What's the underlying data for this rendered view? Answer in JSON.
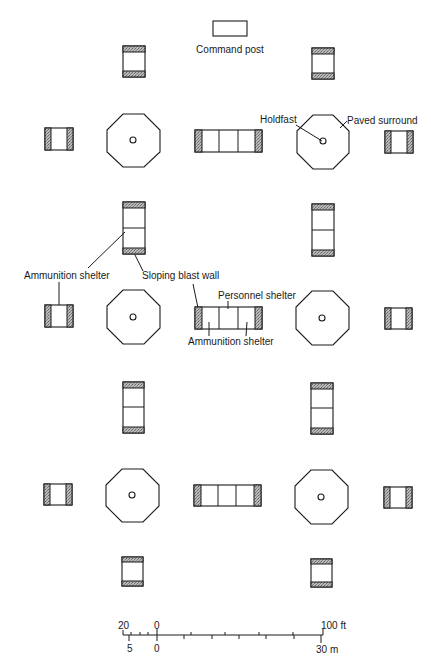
{
  "diagram": {
    "type": "site layout plan",
    "labels": {
      "command_post": "Command post",
      "holdfast": "Holdfast",
      "paved_surround": "Paved surround",
      "ammunition_shelter_left": "Ammunition shelter",
      "sloping_blast_wall": "Sloping blast wall",
      "personnel_shelter": "Personnel shelter",
      "ammunition_shelter_center": "Ammunition shelter"
    },
    "scale_bar": {
      "feet": {
        "left": "20",
        "zero": "0",
        "right": "100 ft"
      },
      "meters": {
        "left": "5",
        "zero": "0",
        "right": "30 m"
      }
    },
    "elements": {
      "command_posts": 1,
      "gun_pads_octagonal": 6,
      "triple_shelters_personnel_ammo": 3,
      "double_ammo_shelters_vertical": 4,
      "single_ammo_shelters": 10
    },
    "colors": {
      "ink": "#1a1a1a",
      "background": "#ffffff",
      "stipple": "#8a8a8a"
    }
  }
}
